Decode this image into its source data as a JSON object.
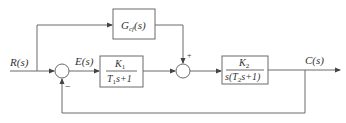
{
  "diagram": {
    "type": "control-system-block-diagram",
    "signals": {
      "input": "R(s)",
      "error": "E(s)",
      "output": "C(s)"
    },
    "blocks": [
      {
        "id": "gcf",
        "label_main": "G",
        "label_sub": "cf",
        "label_arg": "(s)"
      },
      {
        "id": "g1",
        "numerator": "K",
        "numerator_sub": "1",
        "denominator_a": "T",
        "denominator_sub": "1",
        "denominator_b": "s+1"
      },
      {
        "id": "g2",
        "numerator": "K",
        "numerator_sub": "2",
        "denominator_a": "s(T",
        "denominator_sub": "2",
        "denominator_b": "s+1)"
      }
    ],
    "summing_junctions": [
      {
        "id": "sum1",
        "signs": {
          "feedback": "−"
        }
      },
      {
        "id": "sum2",
        "signs": {
          "feedforward": "+"
        }
      }
    ]
  }
}
